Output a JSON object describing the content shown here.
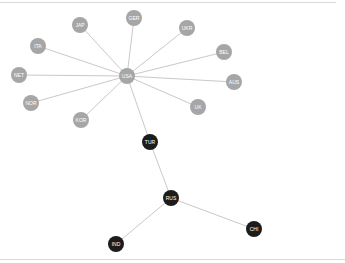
{
  "diagram": {
    "type": "network-graph",
    "colors": {
      "background": "#ffffff",
      "edge": "#c9c9c9",
      "node_gray": "#a6a6a6",
      "node_dark": "#1c1c1c",
      "label": "#ffffff"
    },
    "nodes": [
      {
        "id": "USA",
        "label": "USA",
        "x": 127,
        "y": 76,
        "r": 8,
        "group": "gray"
      },
      {
        "id": "JAP",
        "label": "JAP",
        "x": 80,
        "y": 25,
        "r": 8,
        "group": "gray"
      },
      {
        "id": "GER",
        "label": "GER",
        "x": 134,
        "y": 18,
        "r": 8,
        "group": "gray"
      },
      {
        "id": "UKR",
        "label": "UKR",
        "x": 187,
        "y": 28,
        "r": 8,
        "group": "gray"
      },
      {
        "id": "BEL",
        "label": "BEL",
        "x": 224,
        "y": 52,
        "r": 8,
        "group": "gray"
      },
      {
        "id": "AUS",
        "label": "AUS",
        "x": 234,
        "y": 82,
        "r": 8,
        "group": "gray"
      },
      {
        "id": "UK",
        "label": "UK",
        "x": 198,
        "y": 107,
        "r": 8,
        "group": "gray"
      },
      {
        "id": "ITA",
        "label": "ITA",
        "x": 38,
        "y": 46,
        "r": 8,
        "group": "gray"
      },
      {
        "id": "NET",
        "label": "NET",
        "x": 19,
        "y": 75,
        "r": 8,
        "group": "gray"
      },
      {
        "id": "NOR",
        "label": "NOR",
        "x": 31,
        "y": 103,
        "r": 8,
        "group": "gray"
      },
      {
        "id": "KOR",
        "label": "KOR",
        "x": 81,
        "y": 120,
        "r": 8,
        "group": "gray"
      },
      {
        "id": "TUR",
        "label": "TUR",
        "x": 150,
        "y": 142,
        "r": 8,
        "group": "dark"
      },
      {
        "id": "RUS",
        "label": "RUS",
        "x": 171,
        "y": 198,
        "r": 8,
        "group": "dark"
      },
      {
        "id": "CHI",
        "label": "CHI",
        "x": 254,
        "y": 229,
        "r": 8,
        "group": "dark"
      },
      {
        "id": "IND",
        "label": "IND",
        "x": 116,
        "y": 244,
        "r": 8,
        "group": "dark"
      }
    ],
    "edges": [
      [
        "USA",
        "JAP"
      ],
      [
        "USA",
        "GER"
      ],
      [
        "USA",
        "UKR"
      ],
      [
        "USA",
        "BEL"
      ],
      [
        "USA",
        "AUS"
      ],
      [
        "USA",
        "UK"
      ],
      [
        "USA",
        "ITA"
      ],
      [
        "USA",
        "NET"
      ],
      [
        "USA",
        "NOR"
      ],
      [
        "USA",
        "KOR"
      ],
      [
        "USA",
        "TUR"
      ],
      [
        "TUR",
        "RUS"
      ],
      [
        "RUS",
        "CHI"
      ],
      [
        "RUS",
        "IND"
      ]
    ]
  }
}
